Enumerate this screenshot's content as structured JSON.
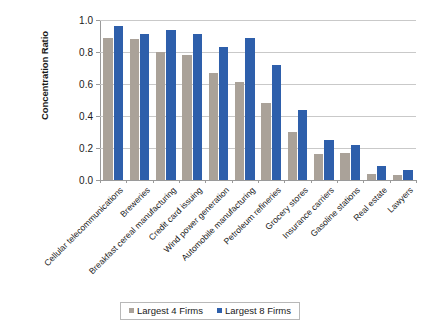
{
  "chart_data": {
    "type": "bar",
    "title": "",
    "xlabel": "",
    "ylabel": "Concentration Ratio",
    "ylim": [
      0.0,
      1.0
    ],
    "ytick_labels": [
      "0.0",
      "0.2",
      "0.4",
      "0.6",
      "0.8",
      "1.0"
    ],
    "ytick_values": [
      0.0,
      0.2,
      0.4,
      0.6,
      0.8,
      1.0
    ],
    "grid": true,
    "legend_position": "bottom",
    "categories": [
      "Cellular telecommunications",
      "Breweries",
      "Breakfast cereal manufacturing",
      "Credit card issuing",
      "Wind power generation",
      "Automobile manufacturing",
      "Petroleum refineries",
      "Grocery stores",
      "Insurance carriers",
      "Gasoline stations",
      "Real estate",
      "Lawyers"
    ],
    "series": [
      {
        "name": "Largest 4 Firms",
        "color": "#aaa299",
        "values": [
          0.89,
          0.88,
          0.8,
          0.78,
          0.67,
          0.61,
          0.48,
          0.3,
          0.16,
          0.17,
          0.04,
          0.03
        ]
      },
      {
        "name": "Largest 8 Firms",
        "color": "#2e5fab",
        "values": [
          0.96,
          0.91,
          0.94,
          0.91,
          0.83,
          0.89,
          0.72,
          0.44,
          0.25,
          0.22,
          0.09,
          0.06
        ]
      }
    ]
  },
  "legend": {
    "items": [
      {
        "label": "Largest 4 Firms",
        "color": "#aaa299"
      },
      {
        "label": "Largest 8 Firms",
        "color": "#2e5fab"
      }
    ]
  },
  "axis": {
    "y_title": "Concentration Ratio"
  }
}
